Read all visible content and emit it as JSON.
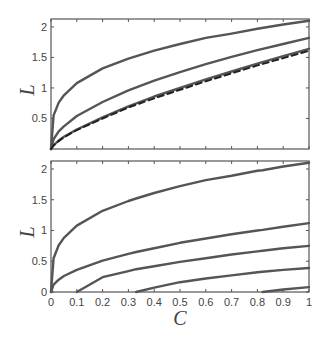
{
  "chart_data": [
    {
      "type": "line",
      "title": "",
      "xlabel": "",
      "ylabel": "L",
      "xlim": [
        0,
        1
      ],
      "ylim": [
        0,
        2.13
      ],
      "yticks": [
        0.5,
        1,
        1.5,
        2
      ],
      "ytick_labels": [
        "0.5",
        "1",
        "1.5",
        "2"
      ],
      "xticks": [
        0,
        0.1,
        0.2,
        0.3,
        0.4,
        0.5,
        0.6,
        0.7,
        0.8,
        0.9,
        1
      ],
      "xtick_labels": [],
      "grid": false,
      "legend": null,
      "x": [
        0,
        0.01,
        0.03,
        0.05,
        0.1,
        0.2,
        0.3,
        0.4,
        0.5,
        0.6,
        0.7,
        0.8,
        0.9,
        1.0
      ],
      "series": [
        {
          "name": "curve-1",
          "style": "solid",
          "values": [
            0,
            0.55,
            0.76,
            0.88,
            1.08,
            1.32,
            1.48,
            1.61,
            1.72,
            1.82,
            1.89,
            1.97,
            2.04,
            2.1
          ]
        },
        {
          "name": "curve-2",
          "style": "solid",
          "values": [
            0,
            0.16,
            0.29,
            0.37,
            0.54,
            0.77,
            0.96,
            1.12,
            1.26,
            1.39,
            1.51,
            1.62,
            1.72,
            1.82
          ]
        },
        {
          "name": "curve-3",
          "style": "solid",
          "values": [
            0,
            0.06,
            0.14,
            0.2,
            0.32,
            0.52,
            0.7,
            0.86,
            1.0,
            1.14,
            1.27,
            1.4,
            1.52,
            1.64
          ]
        },
        {
          "name": "curve-4",
          "style": "dashed",
          "values": [
            0,
            0.06,
            0.13,
            0.19,
            0.31,
            0.5,
            0.68,
            0.83,
            0.97,
            1.11,
            1.24,
            1.37,
            1.49,
            1.61
          ]
        }
      ]
    },
    {
      "type": "line",
      "title": "",
      "xlabel": "C",
      "ylabel": "L",
      "xlim": [
        0,
        1
      ],
      "ylim": [
        0,
        2.13
      ],
      "yticks": [
        0,
        0.5,
        1,
        1.5,
        2
      ],
      "ytick_labels": [
        "0",
        "0.5",
        "1",
        "1.5",
        "2"
      ],
      "xticks": [
        0,
        0.1,
        0.2,
        0.3,
        0.4,
        0.5,
        0.6,
        0.7,
        0.8,
        0.9,
        1
      ],
      "xtick_labels": [
        "0",
        "0.1",
        "0.2",
        "0.3",
        "0.4",
        "0.5",
        "0.6",
        "0.7",
        "0.8",
        "0.9",
        "1"
      ],
      "grid": false,
      "legend": null,
      "x": [
        0,
        0.01,
        0.03,
        0.05,
        0.1,
        0.2,
        0.3,
        0.33,
        0.4,
        0.5,
        0.6,
        0.7,
        0.8,
        0.82,
        0.9,
        1.0
      ],
      "series": [
        {
          "name": "curve-1",
          "style": "solid",
          "values": [
            0,
            0.55,
            0.76,
            0.88,
            1.08,
            1.32,
            1.48,
            1.52,
            1.61,
            1.72,
            1.82,
            1.89,
            1.97,
            1.98,
            2.04,
            2.1
          ]
        },
        {
          "name": "curve-2",
          "style": "solid",
          "values": [
            0,
            0.12,
            0.2,
            0.26,
            0.36,
            0.51,
            0.62,
            0.65,
            0.71,
            0.8,
            0.87,
            0.94,
            1.0,
            1.01,
            1.06,
            1.12
          ]
        },
        {
          "name": "curve-3",
          "style": "solid",
          "values": [
            null,
            null,
            null,
            null,
            0,
            0.24,
            0.34,
            0.37,
            0.42,
            0.49,
            0.55,
            0.61,
            0.66,
            0.67,
            0.71,
            0.75
          ]
        },
        {
          "name": "curve-4",
          "style": "solid",
          "values": [
            null,
            null,
            null,
            null,
            null,
            null,
            null,
            0,
            0.07,
            0.16,
            0.22,
            0.27,
            0.32,
            0.33,
            0.36,
            0.39
          ]
        },
        {
          "name": "curve-5",
          "style": "solid",
          "values": [
            null,
            null,
            null,
            null,
            null,
            null,
            null,
            null,
            null,
            null,
            null,
            null,
            null,
            0,
            0.04,
            0.08
          ]
        }
      ]
    }
  ]
}
